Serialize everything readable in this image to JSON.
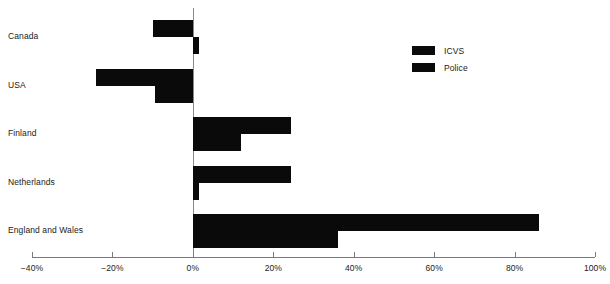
{
  "chart_data": {
    "type": "bar",
    "orientation": "horizontal",
    "title": "",
    "subtitle": "",
    "xlabel": "",
    "ylabel": "",
    "categories": [
      "Canada",
      "USA",
      "Finland",
      "Netherlands",
      "England and Wales"
    ],
    "series": [
      {
        "name": "ICVS",
        "color": "#0a0a0a",
        "values": [
          -10,
          -24,
          24.5,
          24.5,
          86
        ]
      },
      {
        "name": "Police",
        "color": "#0a0a0a",
        "values": [
          1.5,
          -9.5,
          12,
          1.5,
          36
        ]
      }
    ],
    "xlim": [
      -40,
      100
    ],
    "xticks": [
      -40,
      -20,
      0,
      20,
      40,
      60,
      80,
      100
    ],
    "xtick_labels": [
      "−40%",
      "−20%",
      "0%",
      "20%",
      "40%",
      "60%",
      "80%",
      "100%"
    ],
    "grid": false,
    "legend_position": "upper right",
    "zero_line": true
  },
  "legend": {
    "items": [
      {
        "label": "ICVS"
      },
      {
        "label": "Police"
      }
    ]
  },
  "colors": {
    "bar": "#0a0a0a",
    "axis": "#7a7a7a",
    "zero_line": "#8a8a8a",
    "text": "#1a1a1a",
    "background": "#ffffff"
  }
}
